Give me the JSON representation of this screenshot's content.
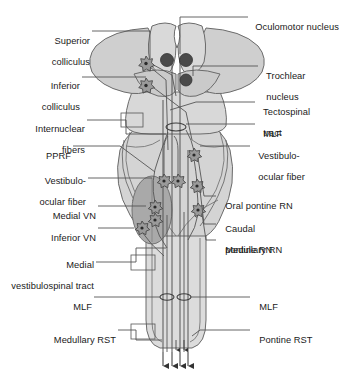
{
  "diagram": {
    "type": "anatomical-schematic",
    "view": "dorsal",
    "colors": {
      "outline": "#6b6b6b",
      "fill_light": "#e3e3e3",
      "fill_mid": "#cccccc",
      "fill_dark": "#a8a8a8",
      "nucleus_dark": "#4a4a4a",
      "leader_line": "#555555",
      "text": "#1a1a1a",
      "background": "#ffffff"
    }
  },
  "labels_left": [
    {
      "id": "superior-colliculus",
      "line1": "Superior",
      "line2": "colliculus"
    },
    {
      "id": "inferior-colliculus",
      "line1": "Inferior",
      "line2": "colliculus"
    },
    {
      "id": "internuclear-fibers",
      "line1": "Internuclear",
      "line2": "fibers"
    },
    {
      "id": "pprf",
      "line1": "PPRF",
      "line2": ""
    },
    {
      "id": "vestibulo-ocular-fiber-left",
      "line1": "Vestibulo-",
      "line2": "ocular fiber"
    },
    {
      "id": "medial-vn",
      "line1": "Medial VN",
      "line2": ""
    },
    {
      "id": "inferior-vn",
      "line1": "Inferior VN",
      "line2": ""
    },
    {
      "id": "medial-vestibulospinal-tract",
      "line1": "Medial",
      "line2": "vestibulospinal tract"
    },
    {
      "id": "mlf-left",
      "line1": "MLF",
      "line2": ""
    },
    {
      "id": "medullary-rst",
      "line1": "Medullary RST",
      "line2": ""
    }
  ],
  "labels_right": [
    {
      "id": "oculomotor-nucleus",
      "line1": "Oculomotor nucleus",
      "line2": ""
    },
    {
      "id": "trochlear-nucleus",
      "line1": "Trochlear",
      "line2": "nucleus"
    },
    {
      "id": "tectospinal-tract",
      "line1": "Tectospinal",
      "line2": "tract"
    },
    {
      "id": "mlf-right-upper",
      "line1": "MLF",
      "line2": ""
    },
    {
      "id": "vestibulo-ocular-fiber-right",
      "line1": "Vestibulo-",
      "line2": "ocular fiber"
    },
    {
      "id": "oral-pontine-rn",
      "line1": "Oral pontine RN",
      "line2": ""
    },
    {
      "id": "caudal-pontine-rn",
      "line1": "Caudal",
      "line2": "pontine RN"
    },
    {
      "id": "medullary-rn",
      "line1": "Medullary RN",
      "line2": ""
    },
    {
      "id": "mlf-right-lower",
      "line1": "MLF",
      "line2": ""
    },
    {
      "id": "pontine-rst",
      "line1": "Pontine RST",
      "line2": ""
    }
  ],
  "structures": {
    "nuclei_filled": [
      {
        "name": "oculomotor-nucleus-left",
        "cx": 167,
        "cy": 60
      },
      {
        "name": "oculomotor-nucleus-right",
        "cx": 186,
        "cy": 60
      },
      {
        "name": "trochlear-nucleus",
        "cx": 186,
        "cy": 80
      }
    ],
    "neuron_stars": [
      {
        "name": "neuron-superior-colliculus",
        "cx": 146,
        "cy": 63
      },
      {
        "name": "neuron-inferior-colliculus",
        "cx": 146,
        "cy": 85
      },
      {
        "name": "neuron-pprf-left",
        "cx": 164,
        "cy": 181
      },
      {
        "name": "neuron-pprf-right",
        "cx": 178,
        "cy": 181
      },
      {
        "name": "neuron-medial-vn",
        "cx": 155,
        "cy": 207
      },
      {
        "name": "neuron-medial-vn-lower",
        "cx": 155,
        "cy": 220
      },
      {
        "name": "neuron-inferior-vn",
        "cx": 142,
        "cy": 228
      },
      {
        "name": "neuron-oral-pontine-rn",
        "cx": 194,
        "cy": 155
      },
      {
        "name": "neuron-caudal-pontine-rn",
        "cx": 197,
        "cy": 186
      },
      {
        "name": "neuron-medullary-rn",
        "cx": 198,
        "cy": 210
      }
    ],
    "mlf_markers": [
      {
        "name": "mlf-marker-upper",
        "cx": 176,
        "cy": 127
      },
      {
        "name": "mlf-marker-lower-left",
        "cx": 167,
        "cy": 297
      },
      {
        "name": "mlf-marker-lower-right",
        "cx": 184,
        "cy": 297
      }
    ],
    "descending_arrows": [
      {
        "name": "descending-arrow-1",
        "x": 163
      },
      {
        "name": "descending-arrow-2",
        "x": 172
      },
      {
        "name": "descending-arrow-3",
        "x": 180
      },
      {
        "name": "descending-arrow-4",
        "x": 188
      }
    ]
  }
}
